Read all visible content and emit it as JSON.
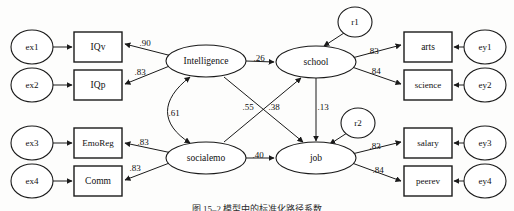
{
  "diagram": {
    "type": "sem-path-diagram",
    "colors": {
      "stroke": "#1a1a1a",
      "fill": "#ffffff",
      "background": "#fdfdfc",
      "text": "#101010"
    },
    "caption": "图 15–2   模型中的标准化路径系数",
    "exogenous_errors": [
      {
        "id": "ex1",
        "label": "ex1",
        "cx": 32,
        "cy": 47,
        "rx": 21,
        "ry": 17
      },
      {
        "id": "ex2",
        "label": "ex2",
        "cx": 32,
        "cy": 85,
        "rx": 21,
        "ry": 17
      },
      {
        "id": "ex3",
        "label": "ex3",
        "cx": 32,
        "cy": 143,
        "rx": 21,
        "ry": 17
      },
      {
        "id": "ex4",
        "label": "ex4",
        "cx": 32,
        "cy": 181,
        "rx": 21,
        "ry": 17
      }
    ],
    "indicators_left": [
      {
        "id": "IQv",
        "label": "IQv",
        "x": 74,
        "y": 32,
        "w": 48,
        "h": 30
      },
      {
        "id": "IQp",
        "label": "IQp",
        "x": 74,
        "y": 70,
        "w": 48,
        "h": 30
      },
      {
        "id": "EmoReg",
        "label": "EmoReg",
        "x": 74,
        "y": 128,
        "w": 48,
        "h": 30
      },
      {
        "id": "Comm",
        "label": "Comm",
        "x": 74,
        "y": 166,
        "w": 48,
        "h": 30
      }
    ],
    "indicators_right": [
      {
        "id": "arts",
        "label": "arts",
        "x": 404,
        "y": 32,
        "w": 48,
        "h": 30
      },
      {
        "id": "science",
        "label": "science",
        "x": 404,
        "y": 70,
        "w": 48,
        "h": 30
      },
      {
        "id": "salary",
        "label": "salary",
        "x": 404,
        "y": 128,
        "w": 48,
        "h": 30
      },
      {
        "id": "peerev",
        "label": "peerev",
        "x": 404,
        "y": 166,
        "w": 48,
        "h": 30
      }
    ],
    "endogenous_errors": [
      {
        "id": "ey1",
        "label": "ey1",
        "cx": 485,
        "cy": 47,
        "rx": 21,
        "ry": 17
      },
      {
        "id": "ey2",
        "label": "ey2",
        "cx": 485,
        "cy": 85,
        "rx": 21,
        "ry": 17
      },
      {
        "id": "ey3",
        "label": "ey3",
        "cx": 485,
        "cy": 143,
        "rx": 21,
        "ry": 17
      },
      {
        "id": "ey4",
        "label": "ey4",
        "cx": 485,
        "cy": 181,
        "rx": 21,
        "ry": 17
      }
    ],
    "disturbances": [
      {
        "id": "r1",
        "label": "r1",
        "cx": 355,
        "cy": 22,
        "rx": 17,
        "ry": 15
      },
      {
        "id": "r2",
        "label": "r2",
        "cx": 358,
        "cy": 123,
        "rx": 17,
        "ry": 15
      }
    ],
    "latents": [
      {
        "id": "Intelligence",
        "label": "Intelligence",
        "cx": 206,
        "cy": 61,
        "rx": 40,
        "ry": 16
      },
      {
        "id": "school",
        "label": "school",
        "cx": 316,
        "cy": 62,
        "rx": 40,
        "ry": 16
      },
      {
        "id": "socialemo",
        "label": "socialemo",
        "cx": 206,
        "cy": 158,
        "rx": 40,
        "ry": 16
      },
      {
        "id": "job",
        "label": "job",
        "cx": 316,
        "cy": 158,
        "rx": 40,
        "ry": 16
      }
    ],
    "coefficients": [
      {
        "id": "intelligence-to-iqv",
        "value": ".90",
        "x": 145,
        "y": 43,
        "from": "Intelligence",
        "to": "IQv"
      },
      {
        "id": "intelligence-to-iqp",
        "value": ".83",
        "x": 140,
        "y": 72,
        "from": "Intelligence",
        "to": "IQp"
      },
      {
        "id": "socialemo-to-emoreg",
        "value": ".83",
        "x": 143,
        "y": 142,
        "from": "socialemo",
        "to": "EmoReg"
      },
      {
        "id": "socialemo-to-comm",
        "value": ".83",
        "x": 135,
        "y": 168,
        "from": "socialemo",
        "to": "Comm"
      },
      {
        "id": "intelligence-to-school",
        "value": ".26",
        "x": 259,
        "y": 58,
        "from": "Intelligence",
        "to": "school"
      },
      {
        "id": "intelligence-socialemo-cov",
        "value": ".61",
        "x": 174,
        "y": 113,
        "from": "Intelligence",
        "to": "socialemo"
      },
      {
        "id": "intelligence-to-job",
        "value": ".55",
        "x": 248,
        "y": 107,
        "from": "Intelligence",
        "to": "job"
      },
      {
        "id": "socialemo-to-school",
        "value": ".38",
        "x": 274,
        "y": 107,
        "from": "socialemo",
        "to": "school"
      },
      {
        "id": "school-to-job",
        "value": ".13",
        "x": 323,
        "y": 107,
        "from": "school",
        "to": "job"
      },
      {
        "id": "socialemo-to-job",
        "value": ".40",
        "x": 258,
        "y": 155,
        "from": "socialemo",
        "to": "job"
      },
      {
        "id": "school-to-arts",
        "value": ".83",
        "x": 373,
        "y": 51,
        "from": "school",
        "to": "arts"
      },
      {
        "id": "school-to-science",
        "value": ".84",
        "x": 375,
        "y": 71,
        "from": "school",
        "to": "science"
      },
      {
        "id": "job-to-salary",
        "value": ".83",
        "x": 375,
        "y": 146,
        "from": "job",
        "to": "salary"
      },
      {
        "id": "job-to-peerev",
        "value": ".84",
        "x": 378,
        "y": 170,
        "from": "job",
        "to": "peerev"
      }
    ]
  }
}
